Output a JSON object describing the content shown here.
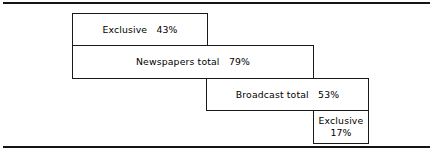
{
  "chart_data": {
    "type": "bar",
    "title": "",
    "subtitle": "",
    "xlabel": "",
    "ylabel": "",
    "orientation": "horizontal",
    "grid": false,
    "legend": "none",
    "xlim": [
      0,
      100
    ],
    "categories": [
      "Exclusive",
      "Newspapers total",
      "Broadcast total",
      "Exclusive"
    ],
    "values": [
      43,
      79,
      53,
      17
    ],
    "value_labels": [
      "43%",
      "79%",
      "53%",
      "17%"
    ],
    "bars": [
      {
        "label": "Exclusive",
        "value": 43,
        "value_label": "43%",
        "text": "Exclusive   43%",
        "group": "newspapers",
        "two_line": false
      },
      {
        "label": "Newspapers total",
        "value": 79,
        "value_label": "79%",
        "text": "Newspapers total   79%",
        "group": "newspapers",
        "two_line": false
      },
      {
        "label": "Broadcast total",
        "value": 53,
        "value_label": "53%",
        "text": "Broadcast total   53%",
        "group": "broadcast",
        "two_line": false
      },
      {
        "label": "Exclusive",
        "value": 17,
        "value_label": "17%",
        "text": "Exclusive\n17%",
        "group": "broadcast",
        "two_line": true
      }
    ]
  },
  "figure": {
    "rule_color": "#141414",
    "bar_border_color": "#1a1a1a",
    "bar_fill_color": "#ffffff",
    "text_color": "#000000"
  }
}
